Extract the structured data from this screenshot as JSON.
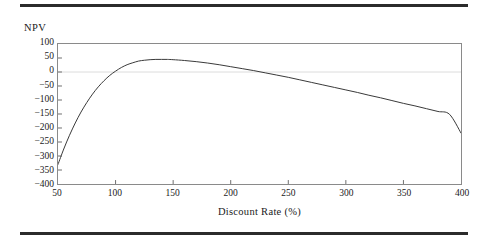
{
  "figure": {
    "background_color": "#ffffff",
    "rule_color": "#2b2b2b",
    "frame_color": "#8a8a8a",
    "curve_color": "#3a3a3a",
    "gridline_color": "#dcdcdc"
  },
  "chart_data": {
    "type": "line",
    "title": "",
    "subtitle": "",
    "xlabel": "Discount Rate (%)",
    "ylabel": "NPV",
    "xlim": [
      50,
      400
    ],
    "ylim": [
      -400,
      100
    ],
    "xticks": [
      50,
      100,
      150,
      200,
      250,
      300,
      350,
      400
    ],
    "yticks": [
      100,
      50,
      0,
      -50,
      -100,
      -150,
      -200,
      -250,
      -300,
      -350,
      -400
    ],
    "xtick_labels": [
      "50",
      "100",
      "150",
      "200",
      "250",
      "300",
      "350",
      "400"
    ],
    "ytick_labels": [
      "100",
      "50",
      "0",
      "−50",
      "−100",
      "−150",
      "−200",
      "−250",
      "−300",
      "−350",
      "−400"
    ],
    "grid": false,
    "gridlines_y": [
      0
    ],
    "legend": null,
    "legend_position": "none",
    "annotations": [],
    "series": [
      {
        "name": "NPV",
        "x": [
          50,
          55,
          60,
          65,
          70,
          75,
          80,
          85,
          90,
          95,
          100,
          105,
          110,
          115,
          120,
          125,
          130,
          135,
          140,
          145,
          150,
          160,
          170,
          180,
          190,
          200,
          210,
          220,
          230,
          240,
          250,
          260,
          270,
          280,
          290,
          300,
          310,
          320,
          330,
          340,
          350,
          360,
          370,
          380,
          390,
          400
        ],
        "y": [
          -330,
          -275,
          -226,
          -182,
          -143,
          -109,
          -79,
          -53,
          -31,
          -12,
          3,
          16,
          26,
          33,
          39,
          42,
          44,
          45,
          45,
          45,
          44,
          41,
          37,
          32,
          26,
          19,
          12,
          5,
          -3,
          -11,
          -19,
          -28,
          -37,
          -46,
          -55,
          -64,
          -73,
          -83,
          -92,
          -102,
          -112,
          -121,
          -131,
          -141,
          -151,
          -218
        ]
      }
    ],
    "notable_points": {
      "start": {
        "x": 50,
        "y": -330
      },
      "zero_crossing": {
        "x": 100,
        "y": 0
      },
      "peak": {
        "x": 140,
        "y": 45
      },
      "end": {
        "x": 400,
        "y": -218
      }
    }
  }
}
